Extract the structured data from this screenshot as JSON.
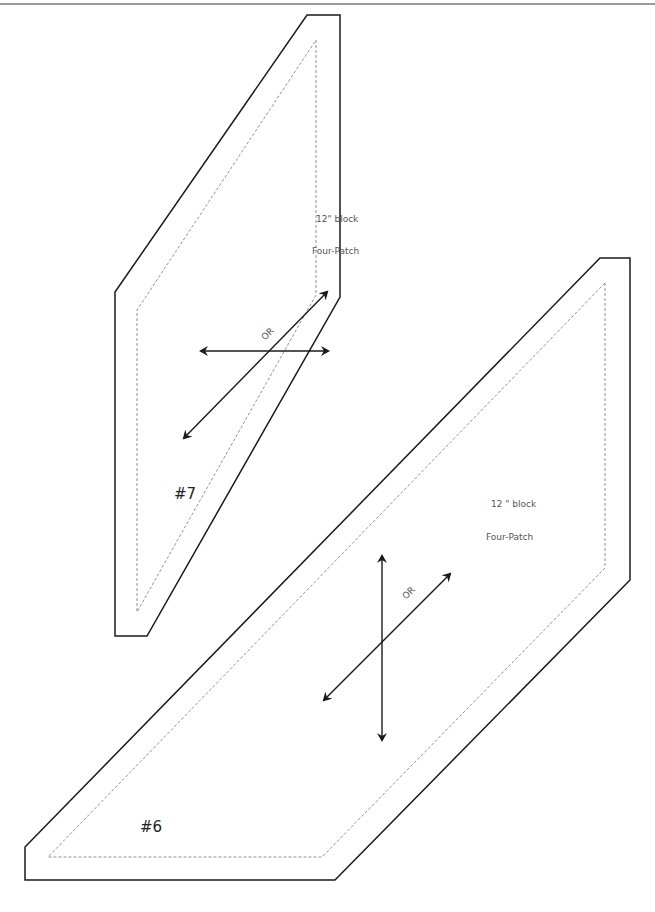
{
  "pieces": [
    {
      "id": "#7",
      "label": "#7",
      "size_text": "12\" block",
      "pattern_text": "Four-Patch",
      "or_text": "OR"
    },
    {
      "id": "#6",
      "label": "#6",
      "size_text": "12 \" block",
      "pattern_text": "Four-Patch",
      "or_text": "OR"
    }
  ],
  "colors": {
    "cut_line": "#1a1a1a",
    "seam_line": "#777777",
    "top_rule": "#9a9a9a"
  }
}
